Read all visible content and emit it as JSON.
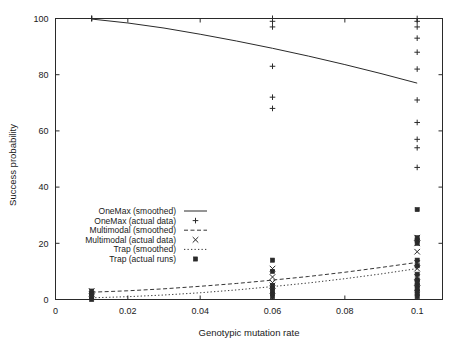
{
  "chart_data": {
    "type": "scatter",
    "title": "",
    "xlabel": "Genotypic mutation rate",
    "ylabel": "Success probability",
    "xlim": [
      0,
      0.107
    ],
    "ylim": [
      0,
      100
    ],
    "xticks": [
      0,
      0.02,
      0.04,
      0.06,
      0.08,
      0.1
    ],
    "xtick_labels": [
      "0",
      "0.02",
      "0.04",
      "0.06",
      "0.08",
      "0.1"
    ],
    "yticks": [
      0,
      20,
      40,
      60,
      80,
      100
    ],
    "ytick_labels": [
      "0",
      "20",
      "40",
      "60",
      "80",
      "100"
    ],
    "grid": false,
    "legend_position": "center-left",
    "series": [
      {
        "name": "OneMax (smoothed)",
        "style": "solid-line",
        "points": [
          {
            "x": 0.01,
            "y": 99.8
          },
          {
            "x": 0.02,
            "y": 98.4
          },
          {
            "x": 0.03,
            "y": 96.6
          },
          {
            "x": 0.04,
            "y": 94.4
          },
          {
            "x": 0.05,
            "y": 92.0
          },
          {
            "x": 0.06,
            "y": 89.4
          },
          {
            "x": 0.07,
            "y": 86.6
          },
          {
            "x": 0.08,
            "y": 83.6
          },
          {
            "x": 0.09,
            "y": 80.4
          },
          {
            "x": 0.1,
            "y": 77.0
          }
        ]
      },
      {
        "name": "OneMax (actual data)",
        "style": "plus-marker",
        "points": [
          {
            "x": 0.01,
            "y": 100
          },
          {
            "x": 0.01,
            "y": 100
          },
          {
            "x": 0.01,
            "y": 100
          },
          {
            "x": 0.06,
            "y": 100
          },
          {
            "x": 0.06,
            "y": 100
          },
          {
            "x": 0.06,
            "y": 99
          },
          {
            "x": 0.06,
            "y": 97
          },
          {
            "x": 0.06,
            "y": 83
          },
          {
            "x": 0.06,
            "y": 72
          },
          {
            "x": 0.06,
            "y": 68
          },
          {
            "x": 0.1,
            "y": 100
          },
          {
            "x": 0.1,
            "y": 99
          },
          {
            "x": 0.1,
            "y": 97
          },
          {
            "x": 0.1,
            "y": 93
          },
          {
            "x": 0.1,
            "y": 88
          },
          {
            "x": 0.1,
            "y": 82
          },
          {
            "x": 0.1,
            "y": 71
          },
          {
            "x": 0.1,
            "y": 63
          },
          {
            "x": 0.1,
            "y": 57
          },
          {
            "x": 0.1,
            "y": 54
          },
          {
            "x": 0.1,
            "y": 47
          }
        ]
      },
      {
        "name": "Multimodal (smoothed)",
        "style": "dashed-line",
        "points": [
          {
            "x": 0.01,
            "y": 2.6
          },
          {
            "x": 0.02,
            "y": 3.1
          },
          {
            "x": 0.03,
            "y": 3.8
          },
          {
            "x": 0.04,
            "y": 4.7
          },
          {
            "x": 0.05,
            "y": 5.7
          },
          {
            "x": 0.06,
            "y": 6.9
          },
          {
            "x": 0.07,
            "y": 8.2
          },
          {
            "x": 0.08,
            "y": 9.7
          },
          {
            "x": 0.09,
            "y": 11.4
          },
          {
            "x": 0.1,
            "y": 13.2
          }
        ]
      },
      {
        "name": "Multimodal (actual data)",
        "style": "cross-marker",
        "points": [
          {
            "x": 0.01,
            "y": 3
          },
          {
            "x": 0.01,
            "y": 2
          },
          {
            "x": 0.01,
            "y": 1
          },
          {
            "x": 0.06,
            "y": 11
          },
          {
            "x": 0.06,
            "y": 8
          },
          {
            "x": 0.06,
            "y": 6
          },
          {
            "x": 0.06,
            "y": 5
          },
          {
            "x": 0.06,
            "y": 3
          },
          {
            "x": 0.1,
            "y": 22
          },
          {
            "x": 0.1,
            "y": 20
          },
          {
            "x": 0.1,
            "y": 17
          },
          {
            "x": 0.1,
            "y": 13
          },
          {
            "x": 0.1,
            "y": 11
          },
          {
            "x": 0.1,
            "y": 8
          },
          {
            "x": 0.1,
            "y": 6
          },
          {
            "x": 0.1,
            "y": 4
          }
        ]
      },
      {
        "name": "Trap (smoothed)",
        "style": "dotted-line",
        "points": [
          {
            "x": 0.01,
            "y": 0.6
          },
          {
            "x": 0.02,
            "y": 1.0
          },
          {
            "x": 0.03,
            "y": 1.6
          },
          {
            "x": 0.04,
            "y": 2.4
          },
          {
            "x": 0.05,
            "y": 3.4
          },
          {
            "x": 0.06,
            "y": 4.6
          },
          {
            "x": 0.07,
            "y": 5.9
          },
          {
            "x": 0.08,
            "y": 7.4
          },
          {
            "x": 0.09,
            "y": 9.1
          },
          {
            "x": 0.1,
            "y": 11.0
          }
        ]
      },
      {
        "name": "Trap (actual runs)",
        "style": "square-marker",
        "points": [
          {
            "x": 0.01,
            "y": 3
          },
          {
            "x": 0.01,
            "y": 2
          },
          {
            "x": 0.01,
            "y": 1
          },
          {
            "x": 0.01,
            "y": 0
          },
          {
            "x": 0.06,
            "y": 14
          },
          {
            "x": 0.06,
            "y": 10
          },
          {
            "x": 0.06,
            "y": 5
          },
          {
            "x": 0.06,
            "y": 4
          },
          {
            "x": 0.06,
            "y": 3
          },
          {
            "x": 0.06,
            "y": 2
          },
          {
            "x": 0.06,
            "y": 1
          },
          {
            "x": 0.1,
            "y": 32
          },
          {
            "x": 0.1,
            "y": 22
          },
          {
            "x": 0.1,
            "y": 21
          },
          {
            "x": 0.1,
            "y": 20
          },
          {
            "x": 0.1,
            "y": 14
          },
          {
            "x": 0.1,
            "y": 12
          },
          {
            "x": 0.1,
            "y": 9
          },
          {
            "x": 0.1,
            "y": 7
          },
          {
            "x": 0.1,
            "y": 6
          },
          {
            "x": 0.1,
            "y": 5
          },
          {
            "x": 0.1,
            "y": 4
          },
          {
            "x": 0.1,
            "y": 3
          },
          {
            "x": 0.1,
            "y": 2
          },
          {
            "x": 0.1,
            "y": 1
          }
        ]
      }
    ],
    "legend_entries": [
      {
        "label": "OneMax (smoothed)",
        "symbol": "solid-line"
      },
      {
        "label": "OneMax (actual data)",
        "symbol": "plus-marker"
      },
      {
        "label": "Multimodal (smoothed)",
        "symbol": "dashed-line"
      },
      {
        "label": "Multimodal (actual data)",
        "symbol": "cross-marker"
      },
      {
        "label": "Trap (smoothed)",
        "symbol": "dotted-line"
      },
      {
        "label": "Trap (actual runs)",
        "symbol": "square-marker"
      }
    ]
  },
  "colors": {
    "ink": "#2a2a2a",
    "background": "#ffffff"
  }
}
